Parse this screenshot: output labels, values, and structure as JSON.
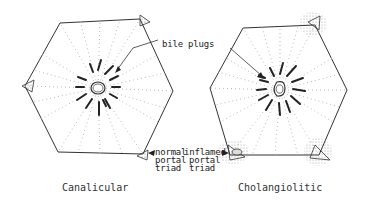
{
  "diagram": {
    "type": "liver-lobule-comparison",
    "panels": [
      {
        "id": "left",
        "caption": "Canalicular",
        "triad_label": [
          "normal",
          "portal",
          "triad"
        ]
      },
      {
        "id": "right",
        "caption": "Cholangiolitic",
        "triad_label": [
          "inflamed",
          "portal",
          "triad"
        ]
      }
    ],
    "shared_label": "bile plugs",
    "colors": {
      "line": "#333333",
      "dots": "#bbbbbb",
      "stipple": "#555555"
    }
  }
}
